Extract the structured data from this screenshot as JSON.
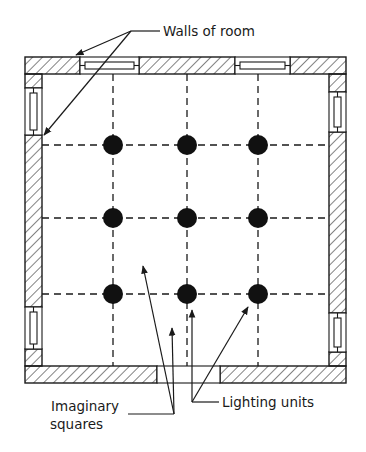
{
  "diagram": {
    "labels": {
      "walls": "Walls of room",
      "squares_line1": "Imaginary",
      "squares_line2": "squares",
      "lighting": "Lighting units"
    },
    "room": {
      "outer": {
        "x": 25,
        "y": 57,
        "width": 321,
        "height": 326
      },
      "wall_thickness": 17
    },
    "grid": {
      "columns_x": [
        113,
        187,
        258
      ],
      "rows_y": [
        145,
        218,
        294
      ],
      "line_style": "dashed"
    },
    "lighting_units": {
      "count": 9,
      "arrangement": "3 x 3",
      "radius": 10,
      "color": "#111111"
    },
    "openings": {
      "top_windows": 2,
      "left_windows": 2,
      "right_windows": 2,
      "bottom_door": 1
    },
    "colors": {
      "ink": "#1a1a1a",
      "background": "#ffffff"
    }
  }
}
